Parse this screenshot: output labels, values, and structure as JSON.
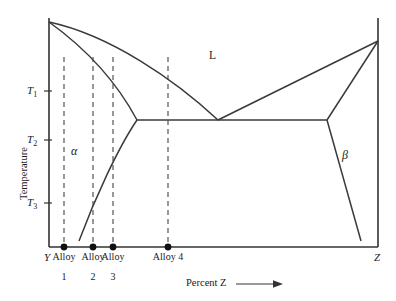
{
  "chart_data": {
    "type": "line",
    "title": "",
    "xlabel": "Percent Z",
    "ylabel": "Temperature",
    "grid": false,
    "legend": null,
    "axis_endpoints": {
      "left": "Y",
      "right": "Z"
    },
    "y_ticks": [
      {
        "label": "T",
        "sub": "1",
        "y_px": 91
      },
      {
        "label": "T",
        "sub": "2",
        "y_px": 140
      },
      {
        "label": "T",
        "sub": "3",
        "y_px": 203
      }
    ],
    "regions": [
      {
        "name": "L",
        "symbol": "L",
        "x_px": 212,
        "y_px": 56,
        "italic": false
      },
      {
        "name": "alpha",
        "symbol": "α",
        "x_px": 74,
        "y_px": 151,
        "italic": true
      },
      {
        "name": "beta",
        "symbol": "β",
        "x_px": 345,
        "y_px": 155,
        "italic": true
      }
    ],
    "alloy_markers": [
      {
        "label": "Alloy",
        "number": "1",
        "x_px": 64
      },
      {
        "label": "Alloy",
        "number": "2",
        "x_px": 93
      },
      {
        "label": "Alloy",
        "number": "3",
        "x_px": 113
      },
      {
        "label": "Alloy 4",
        "number": "",
        "x_px": 168
      }
    ],
    "curves": {
      "left_liquidus": "M49,22 C110,35 175,80 218,120",
      "right_liquidus": "M218,120 L378,41",
      "left_solidus": "M49,22 C95,55 122,92 137,120",
      "right_solidus": "M378,41 L327,120",
      "eutectic_line": "M137,120 L327,120",
      "alpha_solvus": "M137,120 C118,148 95,198 79,241",
      "beta_solvus": "M327,120 L361,241"
    },
    "axes": {
      "left_x_px": 49,
      "right_x_px": 378,
      "top_y_px": 18,
      "bottom_y_px": 247
    },
    "arrow": {
      "name": "x-axis-arrow",
      "direction": "right"
    }
  },
  "labels": {
    "y_axis_title": "Temperature",
    "x_axis_title": "Percent Z",
    "left_endpoint": "Y",
    "right_endpoint": "Z",
    "liquid_region": "L",
    "alpha_region": "α",
    "beta_region": "β",
    "t1": "T",
    "t1_sub": "1",
    "t2": "T",
    "t2_sub": "2",
    "t3": "T",
    "t3_sub": "3",
    "alloy1": "Alloy",
    "alloy1_num": "1",
    "alloy2": "Alloy",
    "alloy2_num": "2",
    "alloy3": "Alloy",
    "alloy3_num": "3",
    "alloy4": "Alloy 4",
    "alloy4_num": ""
  }
}
